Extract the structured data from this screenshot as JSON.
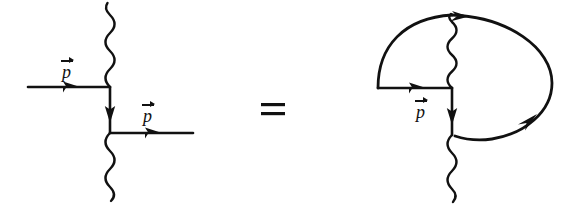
{
  "figure": {
    "type": "feynman-diagram-identity",
    "background_color": "#ffffff",
    "ink_color": "#111111",
    "relation_symbol": "=",
    "momentum_symbol": "p"
  },
  "left_diagram": {
    "name": "tree-level-vertex-pair",
    "labels": [
      {
        "id": "incoming-momentum",
        "text": "p",
        "vector": true
      },
      {
        "id": "outgoing-momentum",
        "text": "p",
        "vector": true
      }
    ],
    "lines": [
      {
        "id": "incoming-fermion",
        "kind": "fermion",
        "direction": "rightward",
        "arrow": true
      },
      {
        "id": "internal-fermion-propagator",
        "kind": "fermion",
        "direction": "downward",
        "arrow": true
      },
      {
        "id": "outgoing-fermion",
        "kind": "fermion",
        "direction": "rightward",
        "arrow": true
      },
      {
        "id": "upper-photon",
        "kind": "photon",
        "direction": "upward",
        "arrow": false
      },
      {
        "id": "lower-photon",
        "kind": "photon",
        "direction": "downward",
        "arrow": false
      }
    ],
    "vertices": [
      {
        "id": "upper-vertex",
        "x": 110,
        "y": 87
      },
      {
        "id": "lower-vertex",
        "x": 110,
        "y": 133
      }
    ]
  },
  "right_diagram": {
    "name": "closed-fermion-loop-vertex-pair",
    "labels": [
      {
        "id": "loop-momentum",
        "text": "p",
        "vector": true
      }
    ],
    "lines": [
      {
        "id": "loop-fermion-straight",
        "kind": "fermion",
        "direction": "rightward",
        "arrow": true
      },
      {
        "id": "internal-fermion-propagator",
        "kind": "fermion",
        "direction": "downward",
        "arrow": true
      },
      {
        "id": "loop-upper-arc",
        "kind": "fermion",
        "direction": "clockwise",
        "arrow": true
      },
      {
        "id": "loop-right-arc",
        "kind": "fermion",
        "direction": "clockwise",
        "arrow": true
      },
      {
        "id": "upper-photon",
        "kind": "photon",
        "direction": "upward",
        "arrow": false
      },
      {
        "id": "lower-photon",
        "kind": "photon",
        "direction": "downward",
        "arrow": false
      }
    ],
    "vertices": [
      {
        "id": "upper-vertex",
        "x": 452,
        "y": 88
      },
      {
        "id": "lower-vertex",
        "x": 452,
        "y": 135
      }
    ]
  },
  "equals": {
    "label": "=",
    "x": 272,
    "y": 110
  }
}
